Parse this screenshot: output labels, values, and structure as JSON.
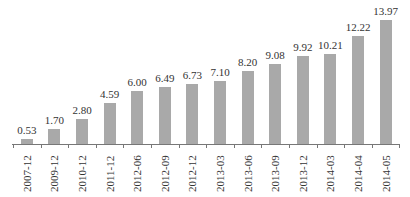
{
  "chart_data": {
    "type": "bar",
    "title": "",
    "xlabel": "",
    "ylabel": "",
    "categories": [
      "2007-12",
      "2009-12",
      "2010-12",
      "2011-12",
      "2012-06",
      "2012-09",
      "2012-12",
      "2013-03",
      "2013-06",
      "2013-09",
      "2013-12",
      "2014-03",
      "2014-04",
      "2014-05"
    ],
    "values": [
      0.53,
      1.7,
      2.8,
      4.59,
      6.0,
      6.49,
      6.73,
      7.1,
      8.2,
      9.08,
      9.92,
      10.21,
      12.22,
      13.97
    ],
    "labels": [
      "0.53",
      "1.70",
      "2.80",
      "4.59",
      "6.00",
      "6.49",
      "6.73",
      "7.10",
      "8.20",
      "9.08",
      "9.92",
      "10.21",
      "12.22",
      "13.97"
    ],
    "ylim": [
      0,
      14
    ],
    "grid": false,
    "legend": null,
    "bar_color": "#a9a9a9"
  }
}
